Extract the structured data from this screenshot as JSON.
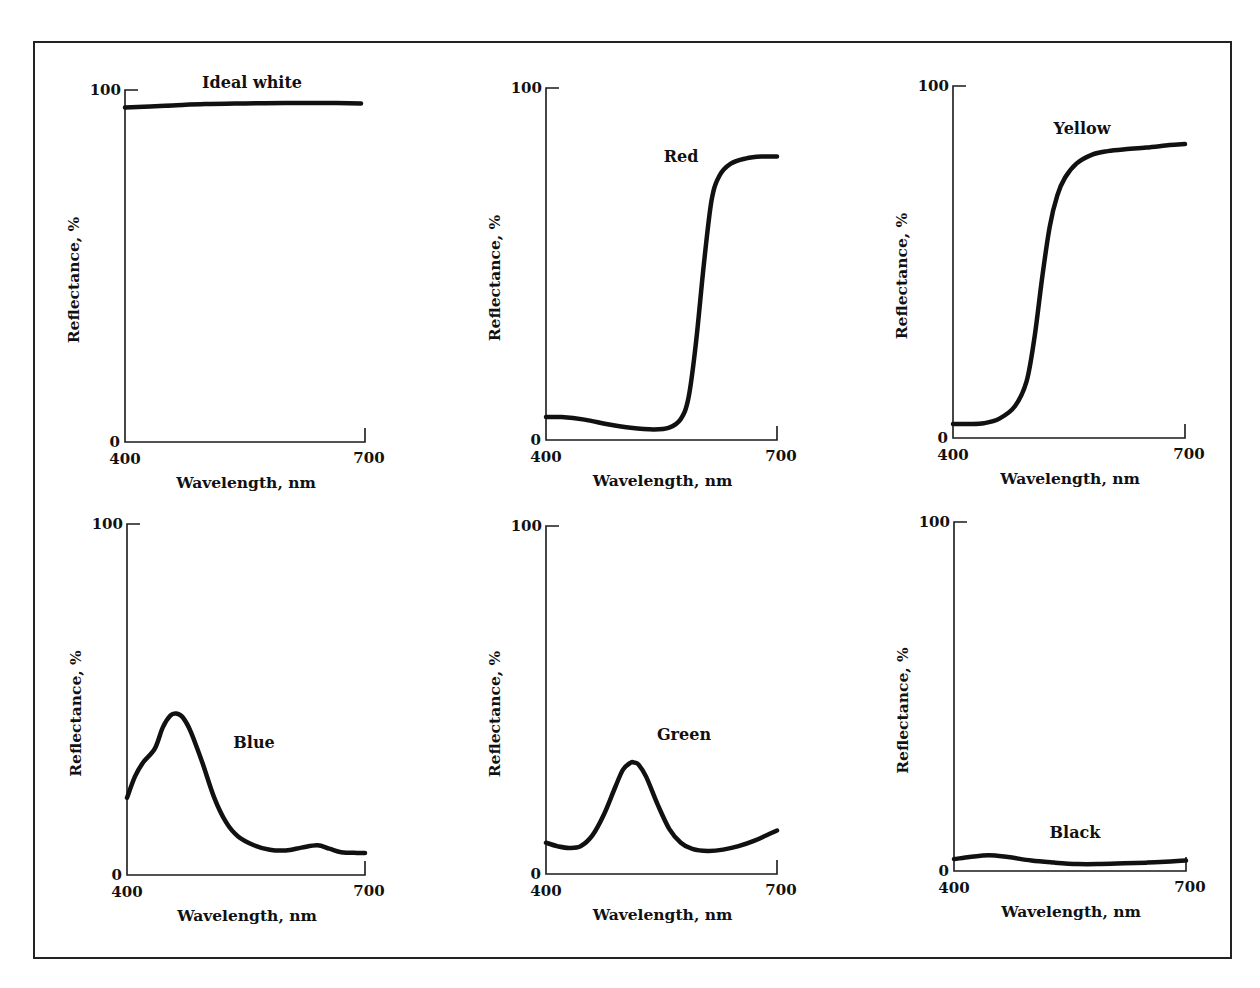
{
  "figure": {
    "frame": true
  },
  "chart_data": [
    {
      "type": "line",
      "title": "Ideal white",
      "xlabel": "Wavelength, nm",
      "ylabel": "Reflectance, %",
      "xlim": [
        400,
        700
      ],
      "ylim": [
        0,
        100
      ],
      "x_ticks": [
        "400",
        "700"
      ],
      "y_ticks": [
        "0",
        "100"
      ],
      "grid": false,
      "x": [
        400,
        450,
        500,
        550,
        600,
        650,
        695
      ],
      "values": [
        95,
        95.5,
        96,
        96.2,
        96.3,
        96.3,
        96.2
      ],
      "layout": {
        "ox": 125,
        "oy": 442,
        "w": 240,
        "h": 352,
        "label_x": 252,
        "label_y": 88
      }
    },
    {
      "type": "line",
      "title": "Red",
      "xlabel": "Wavelength, nm",
      "ylabel": "Reflectance, %",
      "xlim": [
        400,
        700
      ],
      "ylim": [
        0,
        100
      ],
      "x_ticks": [
        "400",
        "700"
      ],
      "y_ticks": [
        "0",
        "100"
      ],
      "grid": false,
      "x": [
        400,
        420,
        450,
        480,
        510,
        540,
        560,
        575,
        585,
        595,
        605,
        615,
        625,
        640,
        660,
        680,
        700
      ],
      "values": [
        6.5,
        6.5,
        5.8,
        4.5,
        3.5,
        3,
        3.5,
        6,
        12,
        28,
        50,
        68,
        75,
        78.5,
        80,
        80.5,
        80.5
      ],
      "layout": {
        "ox": 546,
        "oy": 440,
        "w": 231,
        "h": 352,
        "label_x": 681,
        "label_y": 162
      }
    },
    {
      "type": "line",
      "title": "Yellow",
      "xlabel": "Wavelength, nm",
      "ylabel": "Reflectance, %",
      "xlim": [
        400,
        700
      ],
      "ylim": [
        0,
        100
      ],
      "x_ticks": [
        "400",
        "700"
      ],
      "y_ticks": [
        "0",
        "100"
      ],
      "grid": false,
      "x": [
        400,
        420,
        440,
        460,
        480,
        495,
        505,
        515,
        525,
        535,
        545,
        560,
        580,
        600,
        620,
        650,
        680,
        700
      ],
      "values": [
        4,
        4,
        4.2,
        5.5,
        9,
        16,
        28,
        45,
        60,
        69,
        74,
        78,
        80.5,
        81.5,
        82,
        82.5,
        83.2,
        83.5
      ],
      "layout": {
        "ox": 953,
        "oy": 438,
        "w": 232,
        "h": 352,
        "label_x": 1082,
        "label_y": 134
      }
    },
    {
      "type": "line",
      "title": "Blue",
      "xlabel": "Wavelength, nm",
      "ylabel": "Reflectance, %",
      "xlim": [
        400,
        700
      ],
      "ylim": [
        0,
        100
      ],
      "x_ticks": [
        "400",
        "700"
      ],
      "y_ticks": [
        "0",
        "100"
      ],
      "grid": false,
      "x": [
        400,
        410,
        420,
        435,
        445,
        455,
        462,
        470,
        480,
        495,
        510,
        525,
        540,
        560,
        580,
        600,
        620,
        640,
        655,
        670,
        690,
        700
      ],
      "values": [
        22,
        28,
        32,
        36,
        42,
        45.5,
        46,
        45,
        41,
        32,
        22,
        15,
        11,
        8.5,
        7.2,
        7,
        7.8,
        8.5,
        7.5,
        6.5,
        6.3,
        6.3
      ],
      "layout": {
        "ox": 127,
        "oy": 875,
        "w": 238,
        "h": 351,
        "label_x": 254,
        "label_y": 748
      }
    },
    {
      "type": "line",
      "title": "Green",
      "xlabel": "Wavelength, nm",
      "ylabel": "Reflectance, %",
      "xlim": [
        400,
        700
      ],
      "ylim": [
        0,
        100
      ],
      "x_ticks": [
        "400",
        "700"
      ],
      "y_ticks": [
        "0",
        "100"
      ],
      "grid": false,
      "x": [
        400,
        415,
        430,
        445,
        460,
        475,
        490,
        500,
        510,
        515,
        520,
        530,
        545,
        560,
        575,
        590,
        610,
        630,
        650,
        670,
        685,
        700
      ],
      "values": [
        9,
        8,
        7.5,
        8,
        11,
        17,
        25,
        30,
        32,
        32,
        31.5,
        28,
        20,
        13,
        9,
        7.2,
        6.6,
        7,
        8,
        9.5,
        11,
        12.5
      ],
      "layout": {
        "ox": 546,
        "oy": 874,
        "w": 231,
        "h": 348,
        "label_x": 684,
        "label_y": 740
      }
    },
    {
      "type": "line",
      "title": "Black",
      "xlabel": "Wavelength, nm",
      "ylabel": "Reflectance, %",
      "xlim": [
        400,
        700
      ],
      "ylim": [
        0,
        100
      ],
      "x_ticks": [
        "400",
        "700"
      ],
      "y_ticks": [
        "0",
        "100"
      ],
      "grid": false,
      "x": [
        400,
        420,
        445,
        470,
        500,
        530,
        560,
        590,
        620,
        650,
        680,
        700
      ],
      "values": [
        3.4,
        4,
        4.5,
        4,
        3,
        2.4,
        2,
        2,
        2.2,
        2.4,
        2.7,
        3
      ],
      "layout": {
        "ox": 954,
        "oy": 871,
        "w": 232,
        "h": 349,
        "label_x": 1075,
        "label_y": 838
      }
    }
  ]
}
